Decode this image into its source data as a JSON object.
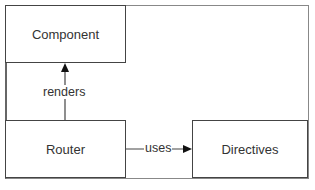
{
  "diagram": {
    "nodes": [
      {
        "id": "component",
        "label": "Component"
      },
      {
        "id": "router",
        "label": "Router"
      },
      {
        "id": "directives",
        "label": "Directives"
      }
    ],
    "edges": [
      {
        "from": "router",
        "to": "component",
        "label": "renders"
      },
      {
        "from": "router",
        "to": "directives",
        "label": "uses"
      }
    ]
  }
}
